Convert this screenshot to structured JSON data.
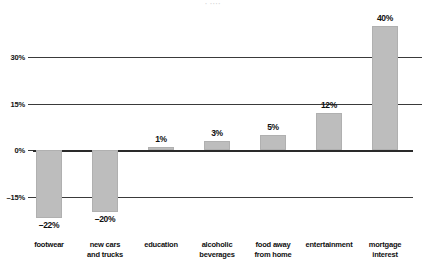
{
  "chart_data": {
    "type": "bar",
    "title": "",
    "subtitle": "",
    "xlabel": "",
    "ylabel": "",
    "categories": [
      "footwear",
      "new cars\nand trucks",
      "education",
      "alcoholic\nbeverages",
      "food away\nfrom home",
      "entertainment",
      "mortgage\ninterest"
    ],
    "values": [
      -22,
      -20,
      1,
      3,
      5,
      12,
      40
    ],
    "value_labels": [
      "–22%",
      "–20%",
      "1%",
      "3%",
      "5%",
      "12%",
      "40%"
    ],
    "ylim": [
      -24,
      44
    ],
    "yticks": [
      -15,
      0,
      15,
      30
    ],
    "ytick_labels": [
      "–15%",
      "0%",
      "15%",
      "30%"
    ],
    "grid": true,
    "legend": "none",
    "series": [
      {
        "name": "percent change",
        "values": [
          -22,
          -20,
          1,
          3,
          5,
          12,
          40
        ]
      }
    ],
    "colors": {
      "bar_fill": "#bdbdbd",
      "bar_stroke": "#b0b0b0",
      "gridline": "#3a3a3a",
      "zero_line": "#2a2a2a",
      "text": "#101010",
      "background": "#ffffff"
    }
  },
  "title_remnant": {
    "text": "· ····"
  }
}
